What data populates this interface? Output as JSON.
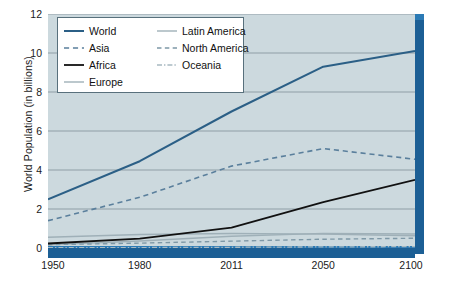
{
  "chart_data": {
    "type": "line",
    "title": "",
    "xlabel": "",
    "ylabel": "World Population (in billions)",
    "x": [
      1950,
      1980,
      2011,
      2050,
      2100
    ],
    "xtick_labels": [
      "1950",
      "1980",
      "2011",
      "2050",
      "2100"
    ],
    "ytick_labels": [
      "0",
      "2",
      "4",
      "6",
      "8",
      "10",
      "12"
    ],
    "yticks": [
      0,
      2,
      4,
      6,
      8,
      10,
      12
    ],
    "ylim": [
      0,
      12
    ],
    "xlim": [
      1950,
      2100
    ],
    "grid": "horizontal",
    "legend_position": "top-left",
    "series": [
      {
        "name": "World",
        "style": "solid",
        "color": "#2b5f86",
        "width": 2.0,
        "values": [
          2.5,
          4.45,
          7.0,
          9.3,
          10.1
        ]
      },
      {
        "name": "Asia",
        "style": "dashed",
        "color": "#5a7f9c",
        "width": 1.6,
        "values": [
          1.4,
          2.6,
          4.2,
          5.1,
          4.55
        ]
      },
      {
        "name": "Africa",
        "style": "solid",
        "color": "#111111",
        "width": 1.8,
        "values": [
          0.23,
          0.48,
          1.05,
          2.35,
          3.5
        ]
      },
      {
        "name": "Europe",
        "style": "solid",
        "color": "#9fb0b8",
        "width": 1.4,
        "values": [
          0.55,
          0.69,
          0.74,
          0.71,
          0.63
        ]
      },
      {
        "name": "Latin America",
        "style": "solid",
        "color": "#9fb0b8",
        "width": 1.4,
        "values": [
          0.17,
          0.36,
          0.6,
          0.75,
          0.72
        ]
      },
      {
        "name": "North America",
        "style": "dashed",
        "color": "#7e98a6",
        "width": 1.4,
        "values": [
          0.17,
          0.25,
          0.35,
          0.45,
          0.5
        ]
      },
      {
        "name": "Oceania",
        "style": "dashdot",
        "color": "#a8b9c1",
        "width": 1.3,
        "values": [
          0.013,
          0.023,
          0.037,
          0.057,
          0.07
        ]
      }
    ]
  },
  "legend": {
    "columns": [
      {
        "items": [
          "World",
          "Asia",
          "Africa",
          "Europe"
        ]
      },
      {
        "items": [
          "Latin America",
          "North America",
          "Oceania"
        ]
      }
    ]
  },
  "colors": {
    "plot_background": "#ccd9de",
    "frame_blue": "#1c5f95",
    "frame_blue_light": "#2b7ab5",
    "gridline": "#8f9ea6",
    "legend_border": "#58707c",
    "page_background": "#ffffff"
  }
}
